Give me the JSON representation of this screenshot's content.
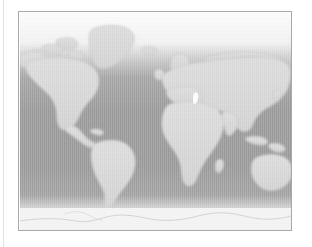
{
  "page": {
    "background_color": "#ffffff",
    "margin_rule_color": "#e2e2e2"
  },
  "figure": {
    "name": "world-map",
    "caption": "",
    "frame_color": "#a9a9a9",
    "projection": "equirectangular",
    "style": "grayscale halftone",
    "colors": {
      "land": "#d9d9d9",
      "land_shadow": "#c6c6c6",
      "coastline": "#b3b3b3",
      "ocean_polar_north": "#fdfdfd",
      "ocean_temperate": "#b9b9b9",
      "ocean_equatorial": "#9b9b9b",
      "ocean_south": "#9a9a9a",
      "antarctica": "#f4f4f4",
      "highlight_marker": "#ffffff"
    },
    "ocean_gradient_stops": [
      {
        "offset": "0%",
        "color": "#fdfdfd"
      },
      {
        "offset": "14%",
        "color": "#f2f2f2"
      },
      {
        "offset": "22%",
        "color": "#c9c9c9"
      },
      {
        "offset": "30%",
        "color": "#a6a6a6"
      },
      {
        "offset": "45%",
        "color": "#9b9b9b"
      },
      {
        "offset": "70%",
        "color": "#9a9a9a"
      },
      {
        "offset": "84%",
        "color": "#a3a3a3"
      },
      {
        "offset": "90%",
        "color": "#d4d4d4"
      },
      {
        "offset": "96%",
        "color": "#f6f6f6"
      },
      {
        "offset": "100%",
        "color": "#fcfcfc"
      }
    ],
    "landmasses": [
      {
        "name": "north-america"
      },
      {
        "name": "greenland"
      },
      {
        "name": "iceland"
      },
      {
        "name": "canadian-arctic-archipelago"
      },
      {
        "name": "alaska"
      },
      {
        "name": "central-america"
      },
      {
        "name": "caribbean"
      },
      {
        "name": "south-america"
      },
      {
        "name": "europe"
      },
      {
        "name": "scandinavia"
      },
      {
        "name": "british-isles"
      },
      {
        "name": "africa"
      },
      {
        "name": "madagascar"
      },
      {
        "name": "asia"
      },
      {
        "name": "siberia"
      },
      {
        "name": "india"
      },
      {
        "name": "japan"
      },
      {
        "name": "indonesia"
      },
      {
        "name": "new-guinea"
      },
      {
        "name": "australia"
      },
      {
        "name": "new-zealand"
      },
      {
        "name": "antarctica"
      }
    ],
    "markers": [
      {
        "name": "highlight-marker",
        "label": ""
      }
    ]
  }
}
